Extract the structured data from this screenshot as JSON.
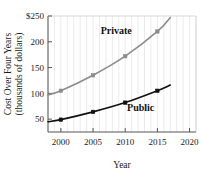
{
  "chart_data": {
    "type": "line",
    "title": "",
    "xlabel": "Year",
    "ylabel": "Cost Over Four Years (thousands of dollars)",
    "ylabel_line1": "Cost Over Four Years",
    "ylabel_line2": "(thousands of dollars)",
    "xlim": [
      1998,
      2021
    ],
    "ylim": [
      25,
      250
    ],
    "xticks": [
      2000,
      2005,
      2010,
      2015,
      2020
    ],
    "xtick_labels": [
      "2000",
      "2005",
      "2010",
      "2015",
      "2020"
    ],
    "yticks": [
      50,
      100,
      150,
      200,
      250
    ],
    "ytick_labels": [
      "50",
      "100",
      "150",
      "200",
      "$250"
    ],
    "grid": "vertical-minor",
    "legend": "inline-annotations",
    "series": [
      {
        "name": "Private",
        "color": "#8c8c8c",
        "label_x": 2008.6,
        "label_y": 222,
        "x": [
          1998,
          2000,
          2005,
          2010,
          2015,
          2017
        ],
        "values": [
          97,
          105,
          135,
          172,
          220,
          247
        ],
        "markers_x": [
          2000,
          2005,
          2010,
          2015
        ],
        "markers_y": [
          105,
          135,
          172,
          220
        ]
      },
      {
        "name": "Public",
        "color": "#111111",
        "label_x": 2012.4,
        "label_y": 72,
        "x": [
          1998,
          2000,
          2005,
          2010,
          2015,
          2017
        ],
        "values": [
          45,
          49,
          64,
          82,
          105,
          116
        ],
        "markers_x": [
          2000,
          2005,
          2010,
          2015
        ],
        "markers_y": [
          49,
          64,
          82,
          105
        ]
      }
    ]
  },
  "colors": {
    "private": "#8c8c8c",
    "public": "#111111",
    "axis": "#555555",
    "gridline": "#e2e2e2",
    "text": "#1a1a1a"
  }
}
